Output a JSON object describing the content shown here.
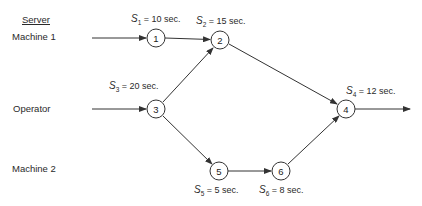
{
  "servers": {
    "header": "Server",
    "rows": [
      {
        "label": "Machine 1"
      },
      {
        "label": "Operator"
      },
      {
        "label": "Machine 2"
      }
    ]
  },
  "nodes": [
    {
      "id": "1",
      "label": "1",
      "annotation": {
        "sym": "S",
        "sub": "1",
        "text": " = 10 sec."
      }
    },
    {
      "id": "2",
      "label": "2",
      "annotation": {
        "sym": "S",
        "sub": "2",
        "text": " = 15 sec."
      }
    },
    {
      "id": "3",
      "label": "3",
      "annotation": {
        "sym": "S",
        "sub": "3",
        "text": " = 20 sec."
      }
    },
    {
      "id": "4",
      "label": "4",
      "annotation": {
        "sym": "S",
        "sub": "4",
        "text": " = 12 sec."
      }
    },
    {
      "id": "5",
      "label": "5",
      "annotation": {
        "sym": "S",
        "sub": "5",
        "text": " = 5 sec."
      }
    },
    {
      "id": "6",
      "label": "6",
      "annotation": {
        "sym": "S",
        "sub": "6",
        "text": " = 8 sec."
      }
    }
  ],
  "edges": [
    {
      "from": "input",
      "to": "1"
    },
    {
      "from": "1",
      "to": "2"
    },
    {
      "from": "input",
      "to": "3"
    },
    {
      "from": "3",
      "to": "2"
    },
    {
      "from": "3",
      "to": "5"
    },
    {
      "from": "2",
      "to": "4"
    },
    {
      "from": "5",
      "to": "6"
    },
    {
      "from": "6",
      "to": "4"
    },
    {
      "from": "4",
      "to": "output"
    }
  ]
}
